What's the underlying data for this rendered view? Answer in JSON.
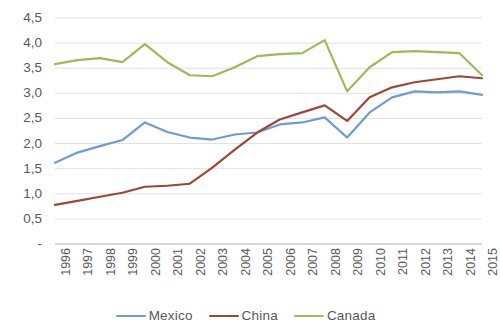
{
  "chart_data": {
    "type": "line",
    "title": "",
    "subtitle": "",
    "xlabel": "",
    "ylabel": "",
    "categories": [
      "1996",
      "1997",
      "1998",
      "1999",
      "2000",
      "2001",
      "2002",
      "2003",
      "2004",
      "2005",
      "2006",
      "2007",
      "2008",
      "2009",
      "2010",
      "2011",
      "2012",
      "2013",
      "2014",
      "2015"
    ],
    "ylim": [
      0,
      4.5
    ],
    "ytick_values": [
      4.5,
      4.0,
      3.5,
      3.0,
      2.5,
      2.0,
      1.5,
      1.0,
      0.5,
      0
    ],
    "ytick_labels": [
      "4,5",
      "4,0",
      "3,5",
      "3,0",
      "2,5",
      "2,0",
      "1,5",
      "1,0",
      "0,5",
      "-"
    ],
    "grid": true,
    "grid_axis": "y",
    "legend_position": "bottom",
    "series": [
      {
        "name": "Mexico",
        "color": "#6E9BD1",
        "values": [
          1.62,
          1.82,
          1.95,
          2.07,
          2.42,
          2.23,
          2.12,
          2.08,
          2.18,
          2.22,
          2.38,
          2.42,
          2.52,
          2.12,
          2.62,
          2.92,
          3.04,
          3.02,
          3.04,
          2.97
        ]
      },
      {
        "name": "China",
        "color": "#9E4638",
        "values": [
          0.78,
          0.86,
          0.94,
          1.02,
          1.14,
          1.16,
          1.2,
          1.52,
          1.88,
          2.22,
          2.48,
          2.62,
          2.76,
          2.45,
          2.92,
          3.12,
          3.22,
          3.28,
          3.34,
          3.3
        ]
      },
      {
        "name": "Canada",
        "color": "#9BBB59",
        "values": [
          3.58,
          3.66,
          3.7,
          3.62,
          3.98,
          3.62,
          3.36,
          3.34,
          3.52,
          3.74,
          3.78,
          3.8,
          4.06,
          3.04,
          3.52,
          3.82,
          3.84,
          3.82,
          3.8,
          3.36
        ]
      }
    ]
  },
  "legend": {
    "entries": [
      {
        "label": "Mexico",
        "color": "#6E9BD1"
      },
      {
        "label": "China",
        "color": "#9E4638"
      },
      {
        "label": "Canada",
        "color": "#9BBB59"
      }
    ]
  }
}
